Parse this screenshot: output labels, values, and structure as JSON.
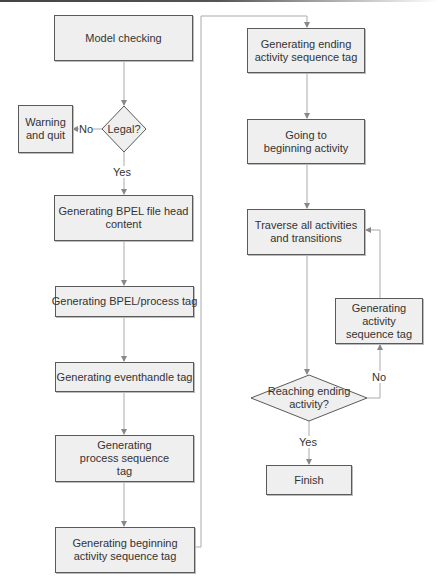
{
  "diagram": {
    "type": "flowchart",
    "colors": {
      "box_fill": "#efefef",
      "box_border": "#5a5a5a",
      "connector": "#aaaaaa",
      "arrowhead": "#888888",
      "text": "#333333"
    },
    "nodes": [
      {
        "id": "model-checking",
        "shape": "rect",
        "label": "Model checking"
      },
      {
        "id": "legal",
        "shape": "diamond",
        "label": "Legal?"
      },
      {
        "id": "warning-quit",
        "shape": "rect",
        "label": "Warning and quit"
      },
      {
        "id": "bpel-file-head",
        "shape": "rect",
        "label": "Generating BPEL file head content"
      },
      {
        "id": "bpel-process-tag",
        "shape": "rect",
        "label": "Generating BPEL/process tag"
      },
      {
        "id": "eventhandle-tag",
        "shape": "rect",
        "label": "Generating eventhandle tag"
      },
      {
        "id": "process-sequence-tag",
        "shape": "rect",
        "label": "Generating process sequence tag"
      },
      {
        "id": "beginning-activity-sequence-tag",
        "shape": "rect",
        "label": "Generating beginning activity sequence tag"
      },
      {
        "id": "ending-activity-sequence-tag",
        "shape": "rect",
        "label": "Generating ending activity sequence tag"
      },
      {
        "id": "going-to-beginning",
        "shape": "rect",
        "label": "Going to beginning activity"
      },
      {
        "id": "traverse",
        "shape": "rect",
        "label": "Traverse all activities and transitions"
      },
      {
        "id": "activity-sequence-tag",
        "shape": "rect",
        "label": "Generating activity sequence tag"
      },
      {
        "id": "reaching-ending",
        "shape": "diamond",
        "label": "Reaching ending activity?"
      },
      {
        "id": "finish",
        "shape": "rect",
        "label": "Finish"
      }
    ],
    "edges": [
      {
        "from": "model-checking",
        "to": "legal",
        "label": ""
      },
      {
        "from": "legal",
        "to": "warning-quit",
        "label": "No"
      },
      {
        "from": "legal",
        "to": "bpel-file-head",
        "label": "Yes"
      },
      {
        "from": "bpel-file-head",
        "to": "bpel-process-tag",
        "label": ""
      },
      {
        "from": "bpel-process-tag",
        "to": "eventhandle-tag",
        "label": ""
      },
      {
        "from": "eventhandle-tag",
        "to": "process-sequence-tag",
        "label": ""
      },
      {
        "from": "process-sequence-tag",
        "to": "beginning-activity-sequence-tag",
        "label": ""
      },
      {
        "from": "beginning-activity-sequence-tag",
        "to": "ending-activity-sequence-tag",
        "label": ""
      },
      {
        "from": "ending-activity-sequence-tag",
        "to": "going-to-beginning",
        "label": ""
      },
      {
        "from": "going-to-beginning",
        "to": "traverse",
        "label": ""
      },
      {
        "from": "traverse",
        "to": "reaching-ending",
        "label": ""
      },
      {
        "from": "reaching-ending",
        "to": "activity-sequence-tag",
        "label": "No"
      },
      {
        "from": "activity-sequence-tag",
        "to": "traverse",
        "label": ""
      },
      {
        "from": "reaching-ending",
        "to": "finish",
        "label": "Yes"
      }
    ],
    "edge_labels": {
      "legal_no": "No",
      "legal_yes": "Yes",
      "reaching_no": "No",
      "reaching_yes": "Yes"
    }
  }
}
